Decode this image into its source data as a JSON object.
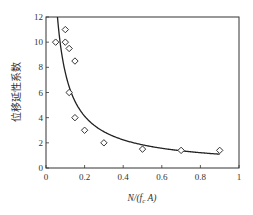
{
  "chart_data": {
    "type": "scatter",
    "title": "",
    "xlabel": "N/(f_c A)",
    "xlabel_parts": {
      "pre": "N/(",
      "f": "f",
      "sub": "c",
      "post": " A)"
    },
    "ylabel": "位移延性系数",
    "xlim": [
      0,
      1
    ],
    "ylim": [
      0,
      12
    ],
    "x_ticks": [
      0,
      0.2,
      0.4,
      0.6,
      0.8,
      1
    ],
    "x_tick_labels": [
      "0",
      "0.2",
      "0.4",
      "0.6",
      "0.8",
      "1"
    ],
    "y_ticks": [
      0,
      2,
      4,
      6,
      8,
      10,
      12
    ],
    "y_tick_labels": [
      "0",
      "2",
      "4",
      "6",
      "8",
      "10",
      "12"
    ],
    "grid": false,
    "legend": null,
    "series": [
      {
        "name": "试验数据",
        "marker": "diamond-open",
        "points": [
          {
            "x": 0.05,
            "y": 10.0
          },
          {
            "x": 0.1,
            "y": 11.0
          },
          {
            "x": 0.1,
            "y": 10.0
          },
          {
            "x": 0.12,
            "y": 9.5
          },
          {
            "x": 0.15,
            "y": 8.5
          },
          {
            "x": 0.12,
            "y": 6.0
          },
          {
            "x": 0.15,
            "y": 4.0
          },
          {
            "x": 0.2,
            "y": 3.0
          },
          {
            "x": 0.3,
            "y": 2.0
          },
          {
            "x": 0.5,
            "y": 1.5
          },
          {
            "x": 0.7,
            "y": 1.4
          },
          {
            "x": 0.9,
            "y": 1.4
          }
        ]
      },
      {
        "name": "拟合曲线",
        "type": "line",
        "formula": "y = a * x^b",
        "a": 1.0,
        "b": -0.88,
        "x_range": [
          0.06,
          0.9
        ]
      }
    ]
  }
}
